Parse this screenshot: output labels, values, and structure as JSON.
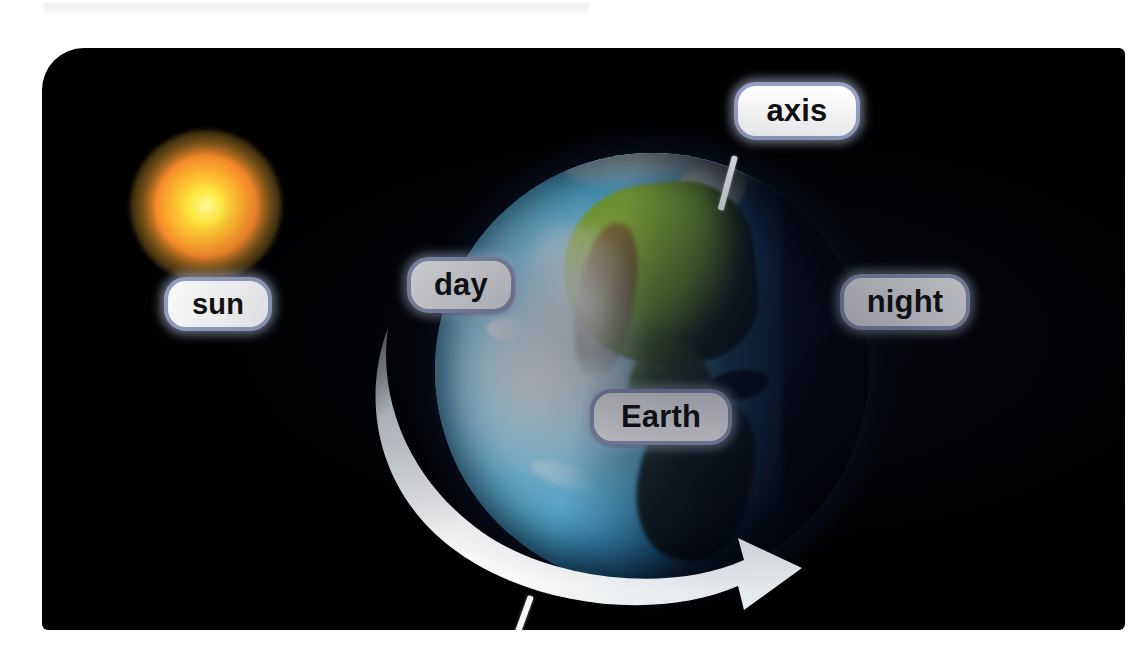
{
  "diagram": {
    "background_color": "#ffffff",
    "panel_color": "#000000",
    "label_border_color": "#9aa0c4",
    "label_text_color": "#111111"
  },
  "labels": {
    "axis": "axis",
    "sun": "sun",
    "day": "day",
    "night": "night",
    "earth": "Earth"
  },
  "objects": {
    "sun": {
      "name": "sun",
      "core_color": "#ffe641",
      "mid_color": "#f8892a",
      "glow_color": "#ffb02a"
    },
    "earth": {
      "name": "Earth",
      "day_side_color": "#5cc0ea",
      "night_side_color": "#16255c",
      "land_color": "#8fc23c",
      "mountain_color": "#96783e"
    },
    "rotation_arrow": {
      "name": "rotation-arrow",
      "color": "#eef1f4",
      "direction": "west-to-east"
    },
    "axis_line": {
      "name": "axis-line",
      "color": "#f4f6fa"
    }
  }
}
